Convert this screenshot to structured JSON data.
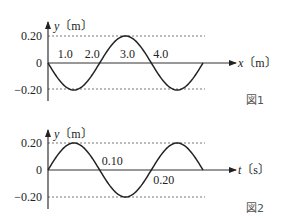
{
  "chart_data": [
    {
      "type": "line",
      "figure_label": "図1",
      "xlabel": "x〔m〕",
      "ylabel": "y〔m〕",
      "x_var": "x",
      "x_unit": "〔m〕",
      "y_var": "y",
      "y_unit": "〔m〕",
      "xlim": [
        0,
        6.0
      ],
      "ylim": [
        -0.2,
        0.2
      ],
      "x_ticks": [
        "1.0",
        "2.0",
        "3.0",
        "4.0"
      ],
      "x_tick_values": [
        1.0,
        2.0,
        3.0,
        4.0
      ],
      "y_ticks": [
        "0.20",
        "0",
        "-0.20"
      ],
      "y_tick_values": [
        0.2,
        0,
        -0.2
      ],
      "amplitude": 0.2,
      "wavelength": 4.0,
      "phase_sign": -1,
      "series": [
        {
          "name": "wave (y vs x)",
          "x": [
            0,
            1.0,
            2.0,
            3.0,
            4.0,
            5.0,
            6.0
          ],
          "y": [
            0,
            -0.2,
            0,
            0.2,
            0,
            -0.2,
            0
          ]
        }
      ],
      "grid": "dashed lines at y=±0.20"
    },
    {
      "type": "line",
      "figure_label": "図2",
      "xlabel": "t〔s〕",
      "ylabel": "y〔m〕",
      "x_var": "t",
      "x_unit": "〔s〕",
      "y_var": "y",
      "y_unit": "〔m〕",
      "xlim": [
        0,
        0.3
      ],
      "ylim": [
        -0.2,
        0.2
      ],
      "x_ticks": [
        "0.10",
        "0.20"
      ],
      "x_tick_values": [
        0.1,
        0.2
      ],
      "y_ticks": [
        "0.20",
        "0",
        "-0.20"
      ],
      "y_tick_values": [
        0.2,
        0,
        -0.2
      ],
      "amplitude": 0.2,
      "period": 0.2,
      "phase_sign": 1,
      "series": [
        {
          "name": "oscillation (y vs t)",
          "x": [
            0,
            0.05,
            0.1,
            0.15,
            0.2,
            0.25,
            0.3
          ],
          "y": [
            0,
            0.2,
            0,
            -0.2,
            0,
            0.2,
            0
          ]
        }
      ],
      "grid": "dashed lines at y=±0.20"
    }
  ]
}
